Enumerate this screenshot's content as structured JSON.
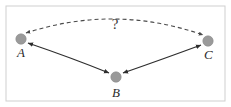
{
  "figure": {
    "name": "causal-relation-diagram",
    "background_color": "#ffffff",
    "frame": {
      "name": "outer-border",
      "color": "#cfcfcf",
      "x": 6,
      "y": 6,
      "width": 219,
      "height": 95
    }
  },
  "nodes": [
    {
      "id": "A",
      "label": "A",
      "cx": 21,
      "cy": 39,
      "r": 5.2,
      "color": "#9a9a9a",
      "label_x": 17,
      "label_y": 57
    },
    {
      "id": "B",
      "label": "B",
      "cx": 116,
      "cy": 77,
      "r": 5.2,
      "color": "#9a9a9a",
      "label_x": 112,
      "label_y": 97
    },
    {
      "id": "C",
      "label": "C",
      "cx": 208,
      "cy": 41,
      "r": 5.2,
      "color": "#9a9a9a",
      "label_x": 204,
      "label_y": 59
    }
  ],
  "edges": [
    {
      "id": "edge-a-b",
      "from": "A",
      "to": "B",
      "style": "solid",
      "arrow": "bidirectional",
      "color": "#2e2e2e",
      "path": "M 28 43 Q 72 58 109 73"
    },
    {
      "id": "edge-b-c",
      "from": "B",
      "to": "C",
      "style": "solid",
      "arrow": "bidirectional",
      "color": "#2e2e2e",
      "path": "M 123 73 Q 166 58 201 45"
    },
    {
      "id": "edge-a-c",
      "from": "A",
      "to": "C",
      "style": "dashed",
      "arrow": "bidirectional",
      "color": "#4a4a4a",
      "path": "M 26 33 Q 115 4 203 35"
    }
  ],
  "annotations": [
    {
      "id": "unknown-relation-marker",
      "text": "?",
      "x": 115,
      "y": 29,
      "color": "#3a3a3a"
    }
  ]
}
